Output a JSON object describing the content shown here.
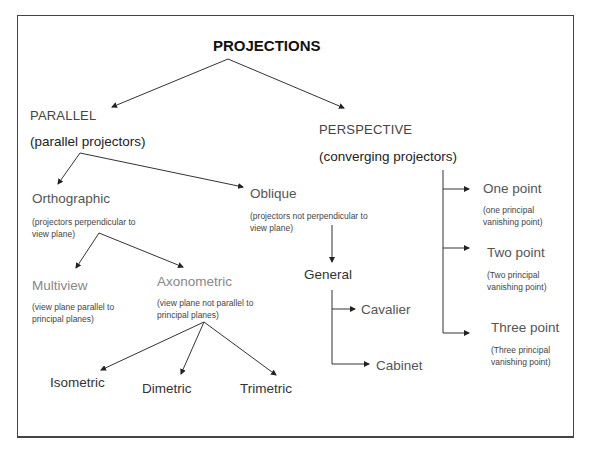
{
  "diagram": {
    "title": "PROJECTIONS",
    "parallel": {
      "label": "PARALLEL",
      "desc": "(parallel projectors)",
      "orthographic": {
        "label": "Orthographic",
        "desc": "(projectors perpendicular to view plane)",
        "multiview": {
          "label": "Multiview",
          "desc": "(view plane parallel to principal planes)"
        },
        "axonometric": {
          "label": "Axonometric",
          "desc": "(view plane not parallel to principal planes)",
          "children": [
            "Isometric",
            "Dimetric",
            "Trimetric"
          ]
        }
      },
      "oblique": {
        "label": "Oblique",
        "desc": "(projectors not perpendicular to view plane)",
        "general": {
          "label": "General",
          "children": [
            "Cavalier",
            "Cabinet"
          ]
        }
      }
    },
    "perspective": {
      "label": "PERSPECTIVE",
      "desc": "(converging projectors)",
      "children": [
        {
          "label": "One point",
          "desc": "(one principal vanishing point)"
        },
        {
          "label": "Two point",
          "desc": "(Two principal vanishing point)"
        },
        {
          "label": "Three point",
          "desc": "(Three principal vanishing point)"
        }
      ]
    }
  }
}
